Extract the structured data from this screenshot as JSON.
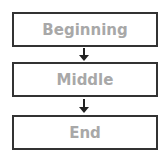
{
  "diagram": {
    "type": "flowchart",
    "nodes": [
      {
        "id": "n1",
        "label": "Beginning"
      },
      {
        "id": "n2",
        "label": "Middle"
      },
      {
        "id": "n3",
        "label": "End"
      }
    ],
    "edges": [
      {
        "from": "n1",
        "to": "n2"
      },
      {
        "from": "n2",
        "to": "n3"
      }
    ],
    "colors": {
      "border": "#333333",
      "text": "#a8a8a8",
      "arrow": "#222222",
      "background": "#ffffff"
    }
  }
}
